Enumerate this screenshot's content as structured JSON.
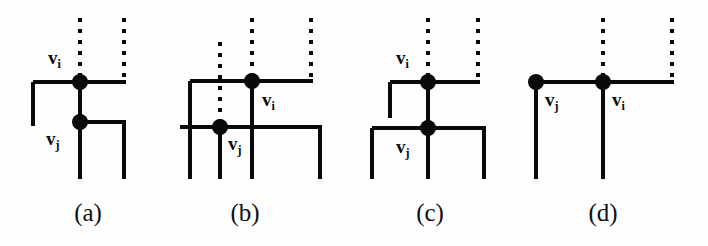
{
  "figure": {
    "background_color": "#fdfdfd",
    "stroke_color": "#0a0a0a",
    "node_fill_color": "#0a0a0a",
    "solid_line_width": 4,
    "dotted_line_width": 4,
    "node_radius": 8
  },
  "panels": [
    {
      "id": "a",
      "caption": "(a)",
      "caption_x": 58,
      "caption_y": 200,
      "nodes": [
        {
          "name": "v_i",
          "label_text": "v",
          "label_sub": "i",
          "cx": 80,
          "cy": 82,
          "label_x": 48,
          "label_y": 48
        },
        {
          "name": "v_j",
          "label_text": "v",
          "label_sub": "j",
          "cx": 80,
          "cy": 122,
          "label_x": 46,
          "label_y": 129
        }
      ],
      "dotted_segments": [
        {
          "x1": 80,
          "y1": 18,
          "x2": 80,
          "y2": 78
        },
        {
          "x1": 124,
          "y1": 18,
          "x2": 124,
          "y2": 80
        }
      ],
      "solid_segments": [
        {
          "x1": 33,
          "y1": 82,
          "x2": 126,
          "y2": 82
        },
        {
          "x1": 33,
          "y1": 82,
          "x2": 33,
          "y2": 126
        },
        {
          "x1": 80,
          "y1": 82,
          "x2": 80,
          "y2": 179
        },
        {
          "x1": 80,
          "y1": 122,
          "x2": 126,
          "y2": 122
        },
        {
          "x1": 124,
          "y1": 122,
          "x2": 124,
          "y2": 179
        }
      ]
    },
    {
      "id": "b",
      "caption": "(b)",
      "caption_x": 215,
      "caption_y": 200,
      "nodes": [
        {
          "name": "v_i",
          "label_text": "v",
          "label_sub": "i",
          "cx": 252,
          "cy": 81,
          "label_x": 262,
          "label_y": 90
        },
        {
          "name": "v_j",
          "label_text": "v",
          "label_sub": "j",
          "cx": 220,
          "cy": 127,
          "label_x": 228,
          "label_y": 134
        }
      ],
      "dotted_segments": [
        {
          "x1": 220,
          "y1": 42,
          "x2": 220,
          "y2": 123
        },
        {
          "x1": 252,
          "y1": 18,
          "x2": 252,
          "y2": 77
        },
        {
          "x1": 311,
          "y1": 18,
          "x2": 311,
          "y2": 79
        }
      ],
      "solid_segments": [
        {
          "x1": 190,
          "y1": 81,
          "x2": 313,
          "y2": 81
        },
        {
          "x1": 190,
          "y1": 81,
          "x2": 190,
          "y2": 179
        },
        {
          "x1": 252,
          "y1": 81,
          "x2": 252,
          "y2": 179
        },
        {
          "x1": 180,
          "y1": 127,
          "x2": 322,
          "y2": 127
        },
        {
          "x1": 220,
          "y1": 127,
          "x2": 220,
          "y2": 179
        },
        {
          "x1": 320,
          "y1": 127,
          "x2": 320,
          "y2": 179
        }
      ]
    },
    {
      "id": "c",
      "caption": "(c)",
      "caption_x": 400,
      "caption_y": 200,
      "nodes": [
        {
          "name": "v_i",
          "label_text": "v",
          "label_sub": "i",
          "cx": 428,
          "cy": 82,
          "label_x": 396,
          "label_y": 48
        },
        {
          "name": "v_j",
          "label_text": "v",
          "label_sub": "j",
          "cx": 428,
          "cy": 128,
          "label_x": 396,
          "label_y": 137
        }
      ],
      "dotted_segments": [
        {
          "x1": 428,
          "y1": 18,
          "x2": 428,
          "y2": 78
        },
        {
          "x1": 478,
          "y1": 18,
          "x2": 478,
          "y2": 80
        }
      ],
      "solid_segments": [
        {
          "x1": 390,
          "y1": 82,
          "x2": 480,
          "y2": 82
        },
        {
          "x1": 390,
          "y1": 82,
          "x2": 390,
          "y2": 118
        },
        {
          "x1": 428,
          "y1": 82,
          "x2": 428,
          "y2": 179
        },
        {
          "x1": 372,
          "y1": 128,
          "x2": 486,
          "y2": 128
        },
        {
          "x1": 372,
          "y1": 128,
          "x2": 372,
          "y2": 179
        },
        {
          "x1": 484,
          "y1": 128,
          "x2": 484,
          "y2": 179
        }
      ]
    },
    {
      "id": "d",
      "caption": "(d)",
      "caption_x": 573,
      "caption_y": 200,
      "nodes": [
        {
          "name": "v_j",
          "label_text": "v",
          "label_sub": "j",
          "cx": 536,
          "cy": 82,
          "label_x": 545,
          "label_y": 90
        },
        {
          "name": "v_i",
          "label_text": "v",
          "label_sub": "i",
          "cx": 603,
          "cy": 82,
          "label_x": 612,
          "label_y": 90
        }
      ],
      "dotted_segments": [
        {
          "x1": 603,
          "y1": 18,
          "x2": 603,
          "y2": 78
        },
        {
          "x1": 672,
          "y1": 18,
          "x2": 672,
          "y2": 80
        }
      ],
      "solid_segments": [
        {
          "x1": 536,
          "y1": 82,
          "x2": 674,
          "y2": 82
        },
        {
          "x1": 536,
          "y1": 82,
          "x2": 536,
          "y2": 179
        },
        {
          "x1": 603,
          "y1": 82,
          "x2": 603,
          "y2": 179
        }
      ]
    }
  ]
}
